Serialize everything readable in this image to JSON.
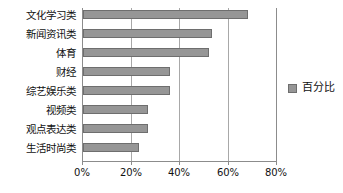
{
  "chart_data": {
    "type": "bar",
    "orientation": "horizontal",
    "title": "",
    "xlabel": "",
    "ylabel": "",
    "categories": [
      "文化学习类",
      "新闻资讯类",
      "体育",
      "财经",
      "综艺娱乐类",
      "视频类",
      "观点表达类",
      "生活时尚类"
    ],
    "values": [
      68,
      53,
      52,
      36,
      36,
      27,
      27,
      23
    ],
    "series": [
      {
        "name": "百分比",
        "values": [
          68,
          53,
          52,
          36,
          36,
          27,
          27,
          23
        ]
      }
    ],
    "xlim": [
      0,
      80
    ],
    "xticks": [
      0,
      20,
      40,
      60,
      80
    ],
    "xtick_labels": [
      "0%",
      "20%",
      "40%",
      "60%",
      "80%"
    ],
    "grid": true,
    "grid_axis": "x",
    "legend_position": "right",
    "bar_color": "#969696",
    "bar_border_color": "#6e6e6e",
    "axis_color": "#8c8c8c",
    "gridline_color": "#a8a8a8",
    "background_color": "#ffffff"
  },
  "legend": {
    "entries": [
      {
        "label": "百分比",
        "color": "#969696"
      }
    ]
  }
}
